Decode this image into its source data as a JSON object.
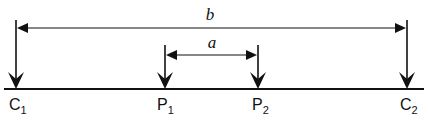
{
  "diagram": {
    "type": "dimension-diagram",
    "dimensions": [
      {
        "id": "b",
        "label": "b",
        "from": "C1",
        "to": "C2"
      },
      {
        "id": "a",
        "label": "a",
        "from": "P1",
        "to": "P2"
      }
    ],
    "points": [
      {
        "id": "C1",
        "letter": "C",
        "subscript": "1"
      },
      {
        "id": "P1",
        "letter": "P",
        "subscript": "1"
      },
      {
        "id": "P2",
        "letter": "P",
        "subscript": "2"
      },
      {
        "id": "C2",
        "letter": "C",
        "subscript": "2"
      }
    ],
    "colors": {
      "stroke": "#111111",
      "background": "#ffffff"
    }
  }
}
